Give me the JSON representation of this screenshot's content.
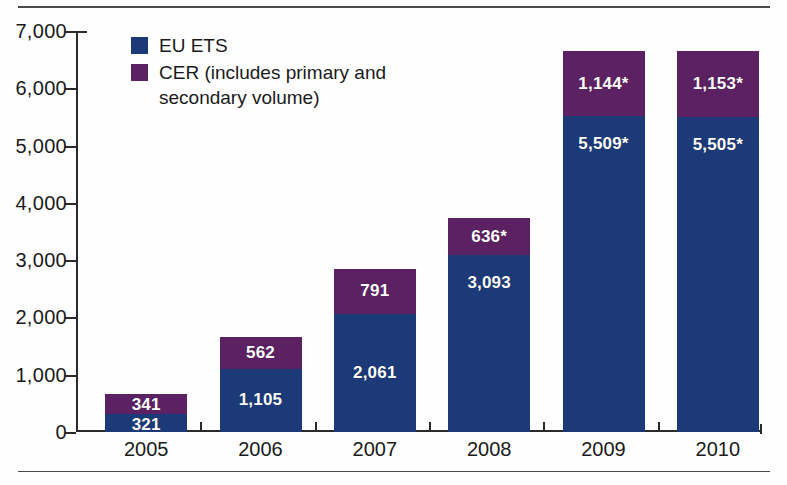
{
  "chart_data": {
    "type": "bar",
    "stacked": true,
    "title": "",
    "xlabel": "",
    "ylabel": "",
    "categories": [
      "2005",
      "2006",
      "2007",
      "2008",
      "2009",
      "2010"
    ],
    "ylim": [
      0,
      7000
    ],
    "yticks": [
      0,
      1000,
      2000,
      3000,
      4000,
      5000,
      6000,
      7000
    ],
    "ytick_labels": [
      "0",
      "1,000",
      "2,000",
      "3,000",
      "4,000",
      "5,000",
      "6,000",
      "7,000"
    ],
    "grid": false,
    "legend_position": "top-left",
    "series": [
      {
        "name": "EU ETS",
        "color": "#1b3a77",
        "values": [
          321,
          1105,
          2061,
          3093,
          5509,
          5505
        ],
        "labels": [
          "321",
          "1,105",
          "2,061",
          "3,093",
          "5,509*",
          "5,505*"
        ]
      },
      {
        "name": "CER (includes primary and secondary volume)",
        "color": "#5c2163",
        "values": [
          341,
          562,
          791,
          636,
          1144,
          1153
        ],
        "labels": [
          "341",
          "562",
          "791",
          "636*",
          "1,144*",
          "1,153*"
        ]
      }
    ],
    "totals": [
      662,
      1667,
      2852,
      3729,
      6653,
      6658
    ]
  },
  "legend": {
    "items": [
      {
        "label": "EU ETS",
        "color": "#1b3a77"
      },
      {
        "label": "CER (includes primary and",
        "label2": "secondary volume)",
        "color": "#5c2163"
      }
    ]
  },
  "colors": {
    "eu_ets": "#1b3a77",
    "cer": "#5c2163",
    "axis": "#2b2b2b",
    "rule": "#4a4a4a",
    "background": "#fefefe"
  }
}
